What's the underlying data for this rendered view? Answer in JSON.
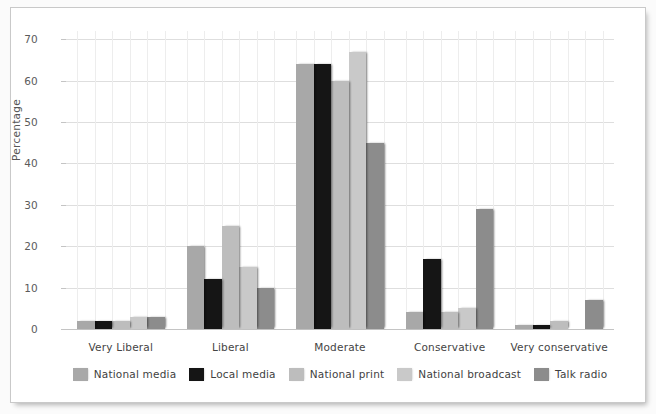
{
  "chart_data": {
    "type": "bar",
    "title": "",
    "subtitle": "",
    "xlabel": "",
    "ylabel": "Percentage",
    "categories": [
      "Very Liberal",
      "Liberal",
      "Moderate",
      "Conservative",
      "Very conservative"
    ],
    "series": [
      {
        "name": "National media",
        "color": "#a8a8a8",
        "values": [
          2,
          20,
          64,
          4,
          1
        ]
      },
      {
        "name": "Local media",
        "color": "#151515",
        "values": [
          2,
          12,
          64,
          17,
          1
        ]
      },
      {
        "name": "National print",
        "color": "#bdbdbd",
        "values": [
          2,
          25,
          60,
          4,
          2
        ]
      },
      {
        "name": "National broadcast",
        "color": "#c9c9c9",
        "values": [
          3,
          15,
          67,
          5,
          0
        ]
      },
      {
        "name": "Talk radio",
        "color": "#8c8c8c",
        "values": [
          3,
          10,
          45,
          29,
          7
        ]
      }
    ],
    "ylim": [
      0,
      72
    ],
    "yticks": [
      0,
      10,
      20,
      30,
      40,
      50,
      60,
      70
    ],
    "ytick_labels": [
      "0",
      "10",
      "20",
      "30",
      "40",
      "50",
      "60",
      "70"
    ],
    "grid": {
      "horizontal": true,
      "vertical": true
    },
    "legend": {
      "position": "bottom",
      "orientation": "horizontal"
    }
  }
}
